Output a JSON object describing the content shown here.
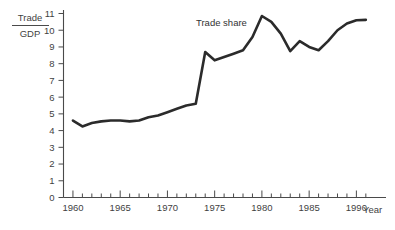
{
  "chart_data": {
    "type": "line",
    "title": "",
    "subtitle": "",
    "xlabel": "Year",
    "ylabel": "Trade/GDP",
    "ylabel_numerator": "Trade",
    "ylabel_denominator": "GDP",
    "series_annotation": "Trade share",
    "grid": false,
    "legend_position": "none",
    "xlim": [
      1959,
      1992.5
    ],
    "ylim": [
      0,
      11
    ],
    "x_tick_step": 1,
    "x_label_step": 5,
    "y_tick_step": 1,
    "xticklabels": [
      "1960",
      "1965",
      "1970",
      "1975",
      "1980",
      "1985",
      "1990"
    ],
    "xticklabel_values": [
      1960,
      1965,
      1970,
      1975,
      1980,
      1985,
      1990
    ],
    "yticklabels": [
      "0",
      "1",
      "2",
      "3",
      "4",
      "5",
      "6",
      "7",
      "8",
      "9",
      "10",
      "11"
    ],
    "yticklabel_values": [
      0,
      1,
      2,
      3,
      4,
      5,
      6,
      7,
      8,
      9,
      10,
      11
    ],
    "line_color": "#2b2b2b",
    "axis_color": "#4a4a4a",
    "background_color": "#ffffff",
    "series": [
      {
        "name": "Trade share",
        "x": [
          1960,
          1961,
          1962,
          1963,
          1964,
          1965,
          1966,
          1967,
          1968,
          1969,
          1970,
          1971,
          1972,
          1973,
          1974,
          1975,
          1976,
          1977,
          1978,
          1979,
          1980,
          1981,
          1982,
          1983,
          1984,
          1985,
          1986,
          1987,
          1988,
          1989,
          1990,
          1991
        ],
        "y": [
          4.6,
          4.25,
          4.45,
          4.55,
          4.6,
          4.6,
          4.55,
          4.6,
          4.8,
          4.9,
          5.1,
          5.3,
          5.5,
          5.6,
          8.7,
          8.2,
          8.4,
          8.6,
          8.8,
          9.6,
          10.85,
          10.5,
          9.8,
          8.75,
          9.35,
          9.0,
          8.8,
          9.35,
          10.0,
          10.4,
          10.6,
          10.62
        ]
      }
    ]
  },
  "annotations": {
    "series_label": "Trade share",
    "series_label_x": 196,
    "series_label_y": 26
  }
}
